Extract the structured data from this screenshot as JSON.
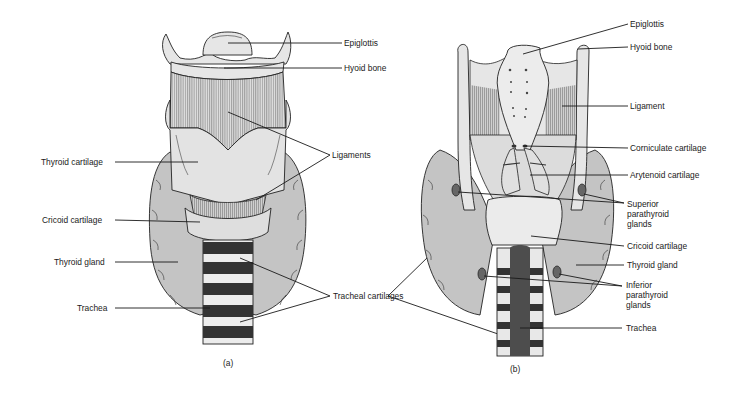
{
  "figure": {
    "panels": [
      {
        "id": "a",
        "caption": "(a)",
        "view": "anterior",
        "labels": {
          "epiglottis": "Epiglottis",
          "hyoid_bone": "Hyoid bone",
          "ligaments": "Ligaments",
          "thyroid_cartilage": "Thyroid cartilage",
          "cricoid_cartilage": "Cricoid cartilage",
          "thyroid_gland": "Thyroid gland",
          "trachea": "Trachea",
          "tracheal_cartilages": "Tracheal cartilages"
        }
      },
      {
        "id": "b",
        "caption": "(b)",
        "view": "posterior",
        "labels": {
          "epiglottis": "Epiglottis",
          "hyoid_bone": "Hyoid bone",
          "ligament": "Ligament",
          "corniculate_cartilage": "Corniculate cartilage",
          "arytenoid_cartilage": "Arytenoid cartilage",
          "superior_parathyroid_1": "Superior",
          "superior_parathyroid_2": "parathyroid",
          "superior_parathyroid_3": "glands",
          "cricoid_cartilage": "Cricoid cartilage",
          "thyroid_gland": "Thyroid gland",
          "inferior_parathyroid_1": "Inferior",
          "inferior_parathyroid_2": "parathyroid",
          "inferior_parathyroid_3": "glands",
          "trachea": "Trachea"
        }
      }
    ],
    "colors": {
      "background": "#ffffff",
      "tissue_light": "#e6e6e6",
      "tissue_mid": "#c9c9c9",
      "gland": "#bdbdbd",
      "dark": "#2b2b2b",
      "trachea_dark": "#4a4a4a",
      "line": "#1a1a1a"
    }
  }
}
